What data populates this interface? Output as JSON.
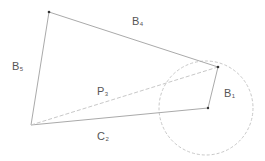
{
  "diagram": {
    "type": "vector-diagram",
    "colors": {
      "solid_line": "#aaaaaa",
      "dashed_line": "#c8c8c8",
      "circle": "#c8c8c8",
      "point": "#333333",
      "label": "#555555",
      "background": "#ffffff"
    },
    "points": [
      {
        "id": "top_left",
        "x": 49,
        "y": 12
      },
      {
        "id": "right",
        "x": 218,
        "y": 67
      },
      {
        "id": "center",
        "x": 208,
        "y": 108
      },
      {
        "id": "bottom_left",
        "x": 31,
        "y": 125
      }
    ],
    "circle": {
      "cx": 206,
      "cy": 108,
      "r": 47,
      "style": "dashed"
    },
    "edges": [
      {
        "name": "B5",
        "from": "bottom_left",
        "to": "top_left",
        "style": "solid"
      },
      {
        "name": "B4",
        "from": "top_left",
        "to": "right",
        "style": "solid"
      },
      {
        "name": "B1",
        "from": "center",
        "to": "right",
        "style": "solid"
      },
      {
        "name": "C2",
        "from": "bottom_left",
        "to": "center",
        "style": "solid"
      },
      {
        "name": "P3",
        "from": "bottom_left",
        "to": "right",
        "style": "dashed"
      }
    ],
    "labels": {
      "b5": {
        "base": "B",
        "sub": "5"
      },
      "b4": {
        "base": "B",
        "sub": "4"
      },
      "p3": {
        "base": "P",
        "sub": "3"
      },
      "c2": {
        "base": "C",
        "sub": "2"
      },
      "b1": {
        "base": "B",
        "sub": "1"
      }
    }
  }
}
